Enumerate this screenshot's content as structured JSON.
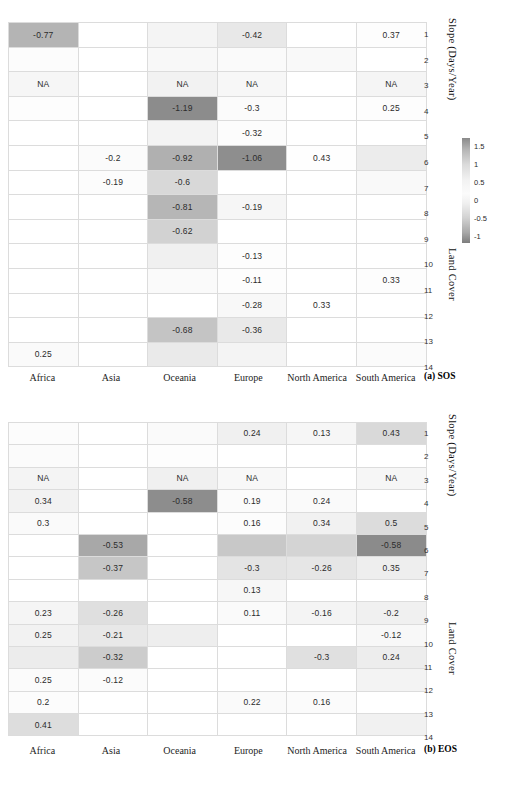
{
  "figure": {
    "rows": 14,
    "continents": [
      "Africa",
      "Asia",
      "Oceania",
      "Europe",
      "North America",
      "South America"
    ],
    "row_numbers": [
      "1",
      "2",
      "3",
      "4",
      "5",
      "6",
      "7",
      "8",
      "9",
      "10",
      "11",
      "12",
      "13",
      "14"
    ],
    "axis_labels": {
      "slope": "Slope (Days/Year)",
      "land_cover": "Land Cover"
    }
  },
  "chart_data": [
    {
      "type": "heatmap",
      "title": "(a) SOS",
      "panel": "a",
      "xlabel": "",
      "ylabel": "Land Cover",
      "cbar_label": "Slope (Days/Year)",
      "categories": [
        "Africa",
        "Asia",
        "Oceania",
        "Europe",
        "North America",
        "South America"
      ],
      "rows": [
        "1",
        "2",
        "3",
        "4",
        "5",
        "6",
        "7",
        "8",
        "9",
        "10",
        "11",
        "12",
        "13",
        "14"
      ],
      "cbar_ticks": [
        "1.5",
        "1",
        "0.5",
        "0",
        "-0.5",
        "-1"
      ],
      "zlim": [
        -1.3,
        1.6
      ],
      "grid": true,
      "values": [
        [
          "-0.77",
          "",
          "",
          "-0.42",
          "",
          "0.37"
        ],
        [
          "",
          "",
          "",
          "",
          "",
          ""
        ],
        [
          "NA",
          "",
          "NA",
          "NA",
          "",
          "NA"
        ],
        [
          "",
          "",
          "-1.19",
          "-0.3",
          "",
          "0.25"
        ],
        [
          "",
          "",
          "",
          "-0.32",
          "",
          ""
        ],
        [
          "",
          "-0.2",
          "-0.92",
          "-1.06",
          "0.43",
          ""
        ],
        [
          "",
          "-0.19",
          "-0.6",
          "",
          "",
          ""
        ],
        [
          "",
          "",
          "-0.81",
          "-0.19",
          "",
          ""
        ],
        [
          "",
          "",
          "-0.62",
          "",
          "",
          ""
        ],
        [
          "",
          "",
          "",
          "-0.13",
          "",
          ""
        ],
        [
          "",
          "",
          "",
          "-0.11",
          "",
          "0.33"
        ],
        [
          "",
          "",
          "",
          "-0.28",
          "0.33",
          ""
        ],
        [
          "",
          "",
          "-0.68",
          "-0.36",
          "",
          ""
        ],
        [
          "0.25",
          "",
          "",
          "",
          "",
          ""
        ]
      ],
      "shades": [
        [
          "#b4b4b4",
          "#ffffff",
          "#f4f4f4",
          "#e8e8e8",
          "#ffffff",
          "#fdfdfd"
        ],
        [
          "#fcfcfc",
          "#ffffff",
          "#f8f8f8",
          "#fafafa",
          "#f9f9f9",
          "#ffffff"
        ],
        [
          "#f6f6f6",
          "#ffffff",
          "#f2f2f2",
          "#f7f7f7",
          "#ffffff",
          "#f5f5f5"
        ],
        [
          "#fdfdfd",
          "#ffffff",
          "#8c8c8c",
          "#fbfbfb",
          "#ffffff",
          "#fdfdfd"
        ],
        [
          "#ffffff",
          "#ffffff",
          "#f3f3f3",
          "#fcfcfc",
          "#ffffff",
          "#ffffff"
        ],
        [
          "#ffffff",
          "#fbfbfb",
          "#b0b0b0",
          "#8e8e8e",
          "#fefefe",
          "#ececec"
        ],
        [
          "#ffffff",
          "#fcfcfc",
          "#d8d8d8",
          "#ffffff",
          "#ffffff",
          "#f9f9f9"
        ],
        [
          "#ffffff",
          "#ffffff",
          "#b6b6b6",
          "#f6f6f6",
          "#ffffff",
          "#ffffff"
        ],
        [
          "#ffffff",
          "#ffffff",
          "#d2d2d2",
          "#ffffff",
          "#ffffff",
          "#ffffff"
        ],
        [
          "#ffffff",
          "#ffffff",
          "#f0f0f0",
          "#fdfdfd",
          "#ffffff",
          "#ffffff"
        ],
        [
          "#ffffff",
          "#ffffff",
          "#fafafa",
          "#fdfdfd",
          "#ffffff",
          "#fdfdfd"
        ],
        [
          "#ffffff",
          "#ffffff",
          "#ffffff",
          "#f8f8f8",
          "#ffffff",
          "#ffffff"
        ],
        [
          "#ffffff",
          "#ffffff",
          "#c4c4c4",
          "#e9e9e9",
          "#ffffff",
          "#ffffff"
        ],
        [
          "#fafafa",
          "#ffffff",
          "#eaeaea",
          "#f4f4f4",
          "#ffffff",
          "#fbfbfb"
        ]
      ],
      "dark_text": [
        [
          true,
          false,
          false,
          false,
          false,
          false
        ],
        [
          false,
          false,
          false,
          false,
          false,
          false
        ],
        [
          false,
          false,
          false,
          false,
          false,
          false
        ],
        [
          false,
          false,
          true,
          false,
          false,
          false
        ],
        [
          false,
          false,
          false,
          false,
          false,
          false
        ],
        [
          false,
          false,
          true,
          true,
          false,
          false
        ],
        [
          false,
          false,
          false,
          false,
          false,
          false
        ],
        [
          false,
          false,
          true,
          false,
          false,
          false
        ],
        [
          false,
          false,
          false,
          false,
          false,
          false
        ],
        [
          false,
          false,
          false,
          false,
          false,
          false
        ],
        [
          false,
          false,
          false,
          false,
          false,
          false
        ],
        [
          false,
          false,
          false,
          false,
          false,
          false
        ],
        [
          false,
          false,
          true,
          false,
          false,
          false
        ],
        [
          false,
          false,
          false,
          false,
          false,
          false
        ]
      ]
    },
    {
      "type": "heatmap",
      "title": "(b) EOS",
      "panel": "b",
      "xlabel": "",
      "ylabel": "Land Cover",
      "cbar_label": "Slope (Days/Year)",
      "categories": [
        "Africa",
        "Asia",
        "Oceania",
        "Europe",
        "North America",
        "South America"
      ],
      "rows": [
        "1",
        "2",
        "3",
        "4",
        "5",
        "6",
        "7",
        "8",
        "9",
        "10",
        "11",
        "12",
        "13",
        "14"
      ],
      "cbar_ticks": [
        "0.6",
        "0.4",
        "0.2",
        "0",
        "-0.2",
        "-0.4"
      ],
      "zlim": [
        -0.6,
        0.7
      ],
      "grid": true,
      "values": [
        [
          "",
          "",
          "",
          "0.24",
          "0.13",
          "0.43"
        ],
        [
          "",
          "",
          "",
          "",
          "",
          ""
        ],
        [
          "NA",
          "",
          "NA",
          "NA",
          "",
          "NA"
        ],
        [
          "0.34",
          "",
          "-0.58",
          "0.19",
          "0.24",
          ""
        ],
        [
          "0.3",
          "",
          "",
          "0.16",
          "0.34",
          "0.5"
        ],
        [
          "",
          "-0.53",
          "",
          "",
          "",
          "-0.58"
        ],
        [
          "",
          "-0.37",
          "",
          "-0.3",
          "-0.26",
          "0.35"
        ],
        [
          "",
          "",
          "",
          "0.13",
          "",
          ""
        ],
        [
          "0.23",
          "-0.26",
          "",
          "0.11",
          "-0.16",
          "-0.2"
        ],
        [
          "0.25",
          "-0.21",
          "",
          "",
          "",
          "-0.12"
        ],
        [
          "",
          "-0.32",
          "",
          "",
          "-0.3",
          "0.24"
        ],
        [
          "0.25",
          "-0.12",
          "",
          "",
          "",
          ""
        ],
        [
          "0.2",
          "",
          "",
          "0.22",
          "0.16",
          ""
        ],
        [
          "0.41",
          "",
          "",
          "",
          "",
          ""
        ]
      ],
      "shades": [
        [
          "#fcfcfc",
          "#ffffff",
          "#fafafa",
          "#f0f0f0",
          "#f6f6f6",
          "#d9d9d9"
        ],
        [
          "#fbfbfb",
          "#ffffff",
          "#fdfdfd",
          "#ffffff",
          "#ffffff",
          "#ffffff"
        ],
        [
          "#f4f4f4",
          "#ffffff",
          "#f0f0f0",
          "#f8f8f8",
          "#ffffff",
          "#f6f6f6"
        ],
        [
          "#f2f2f2",
          "#ffffff",
          "#8d8d8d",
          "#fbfbfb",
          "#fafafa",
          "#ffffff"
        ],
        [
          "#fafafa",
          "#ffffff",
          "#ffffff",
          "#fcfcfc",
          "#f1f1f1",
          "#dcdcdc"
        ],
        [
          "#ffffff",
          "#a8a8a8",
          "#ffffff",
          "#c8c8c8",
          "#d4d4d4",
          "#8b8b8b"
        ],
        [
          "#ffffff",
          "#c6c6c6",
          "#ffffff",
          "#e4e4e4",
          "#e6e6e6",
          "#eeeeee"
        ],
        [
          "#ffffff",
          "#ffffff",
          "#ffffff",
          "#f7f7f7",
          "#ffffff",
          "#ffffff"
        ],
        [
          "#f5f5f5",
          "#dfdfdf",
          "#ffffff",
          "#fafafa",
          "#f4f4f4",
          "#f0f0f0"
        ],
        [
          "#f2f2f2",
          "#e8e8e8",
          "#eeeeee",
          "#ffffff",
          "#ffffff",
          "#f8f8f8"
        ],
        [
          "#ececec",
          "#cccccc",
          "#ffffff",
          "#ffffff",
          "#e0e0e0",
          "#ededed"
        ],
        [
          "#fbfbfb",
          "#fbfbfb",
          "#ffffff",
          "#ffffff",
          "#ffffff",
          "#f3f3f3"
        ],
        [
          "#fcfcfc",
          "#ffffff",
          "#ffffff",
          "#fafafa",
          "#fbfbfb",
          "#ffffff"
        ],
        [
          "#dddddd",
          "#ffffff",
          "#ffffff",
          "#ffffff",
          "#ffffff",
          "#f1f1f1"
        ]
      ],
      "dark_text": [
        [
          false,
          false,
          false,
          false,
          false,
          false
        ],
        [
          false,
          false,
          false,
          false,
          false,
          false
        ],
        [
          false,
          false,
          false,
          false,
          false,
          false
        ],
        [
          false,
          false,
          true,
          false,
          false,
          false
        ],
        [
          false,
          false,
          false,
          false,
          false,
          false
        ],
        [
          false,
          true,
          false,
          false,
          false,
          true
        ],
        [
          false,
          false,
          false,
          false,
          false,
          false
        ],
        [
          false,
          false,
          false,
          false,
          false,
          false
        ],
        [
          false,
          false,
          false,
          false,
          false,
          false
        ],
        [
          false,
          false,
          false,
          false,
          false,
          false
        ],
        [
          false,
          false,
          false,
          false,
          false,
          false
        ],
        [
          false,
          false,
          false,
          false,
          false,
          false
        ],
        [
          false,
          false,
          false,
          false,
          false,
          false
        ],
        [
          false,
          false,
          false,
          false,
          false,
          false
        ]
      ]
    }
  ]
}
